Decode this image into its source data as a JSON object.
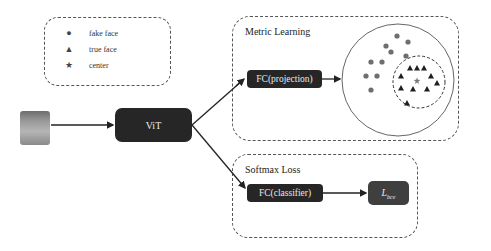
{
  "legend": {
    "items": [
      {
        "symbol": "circle",
        "glyph": "●",
        "label": "fake face"
      },
      {
        "symbol": "triangle",
        "glyph": "▲",
        "label": "true face"
      },
      {
        "symbol": "star",
        "glyph": "★",
        "label": "center"
      }
    ]
  },
  "input": {
    "icon": "face-image"
  },
  "encoder": {
    "label": "ViT"
  },
  "metric_panel": {
    "title": "Metric Learning",
    "head_label": "FC(projection)"
  },
  "softmax_panel": {
    "title": "Softmax Loss",
    "head_label": "FC(classifier)",
    "loss_main": "L",
    "loss_sub": "bce"
  },
  "embedding": {
    "fake_points": [
      [
        397,
        36
      ],
      [
        408,
        42
      ],
      [
        386,
        46
      ],
      [
        391,
        52
      ],
      [
        406,
        56
      ],
      [
        371,
        62
      ],
      [
        382,
        62
      ],
      [
        366,
        76
      ],
      [
        377,
        76
      ],
      [
        371,
        90
      ]
    ],
    "true_points": [
      [
        410,
        68
      ],
      [
        417,
        68
      ],
      [
        424,
        68
      ],
      [
        401,
        76
      ],
      [
        431,
        76
      ],
      [
        437,
        83
      ],
      [
        401,
        88
      ],
      [
        413,
        89
      ],
      [
        427,
        89
      ],
      [
        407,
        103
      ]
    ],
    "center": [
      417,
      81
    ],
    "outer_circle": {
      "cx": 398,
      "cy": 80,
      "r": 56
    },
    "inner_circle": {
      "cx": 419,
      "cy": 82,
      "r": 26
    },
    "colors": {
      "fake": "#6e6e6e",
      "true": "#1f1f1f",
      "center": "#7a7a7a"
    }
  }
}
